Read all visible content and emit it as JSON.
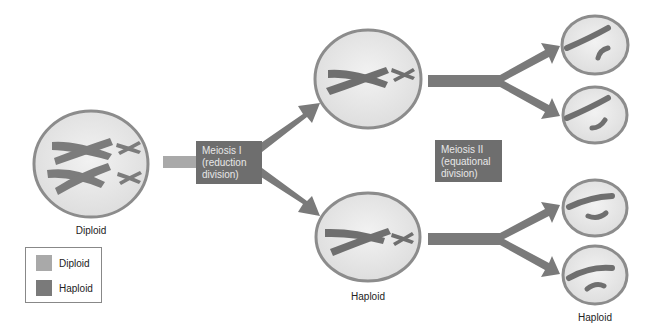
{
  "diagram": {
    "colors": {
      "diploid": "#a9a9a9",
      "haploid": "#7a7a7a",
      "arrow": "#7a7a7a",
      "cell_border": "#8c8c8c",
      "cell_fill": "#e8e8e8",
      "stage_box": "#6e6e6e",
      "stage_text": "#e8e8e8"
    },
    "labels": {
      "parent_cell": "Diploid",
      "meiosis1_cell": "Haploid",
      "daughter_cells": "Haploid"
    },
    "stages": [
      {
        "line1": "Meiosis I",
        "line2": "(reduction",
        "line3": "division)"
      },
      {
        "line1": "Meiosis II",
        "line2": "(equational",
        "line3": "division)"
      }
    ],
    "legend": {
      "items": [
        {
          "label": "Diploid",
          "color": "#a9a9a9"
        },
        {
          "label": "Haploid",
          "color": "#7a7a7a"
        }
      ]
    }
  }
}
